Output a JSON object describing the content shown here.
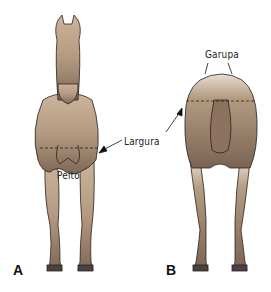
{
  "diagram": {
    "labels": {
      "garupa": "Garupa",
      "largura": "Largura",
      "peito": "Peito"
    },
    "panels": {
      "a": "A",
      "b": "B"
    },
    "colors": {
      "body_light": "#c9b29a",
      "body_mid": "#a88e76",
      "body_dark": "#7d6552",
      "outline": "#2a2220",
      "hoof": "#4a4242"
    }
  }
}
